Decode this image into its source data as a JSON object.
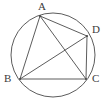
{
  "figure": {
    "background_color": "#ffffff",
    "stroke_color": "#4a4a4a",
    "label_color": "#3b3b3b",
    "circle": {
      "name": "circumcircle",
      "cx": 53,
      "cy": 55,
      "r": 42
    },
    "vertices": [
      {
        "id": "A",
        "label": "A",
        "x": 40,
        "y": 16,
        "label_x": 38,
        "label_y": 1
      },
      {
        "id": "B",
        "label": "B",
        "x": 20,
        "y": 79,
        "label_x": 4,
        "label_y": 73
      },
      {
        "id": "C",
        "label": "C",
        "x": 86,
        "y": 79,
        "label_x": 92,
        "label_y": 73
      },
      {
        "id": "D",
        "label": "D",
        "x": 87,
        "y": 36,
        "label_x": 92,
        "label_y": 24
      }
    ],
    "segments": [
      {
        "name": "side-AB",
        "from": "A",
        "to": "B",
        "x1": 40,
        "y1": 16,
        "x2": 20,
        "y2": 79
      },
      {
        "name": "side-AD",
        "from": "A",
        "to": "D",
        "x1": 40,
        "y1": 16,
        "x2": 87,
        "y2": 36
      },
      {
        "name": "side-DC",
        "from": "D",
        "to": "C",
        "x1": 87,
        "y1": 36,
        "x2": 86,
        "y2": 79
      },
      {
        "name": "side-BC",
        "from": "B",
        "to": "C",
        "x1": 20,
        "y1": 79,
        "x2": 86,
        "y2": 79
      },
      {
        "name": "diagonal-AC",
        "from": "A",
        "to": "C",
        "x1": 40,
        "y1": 16,
        "x2": 86,
        "y2": 79
      },
      {
        "name": "diagonal-BD",
        "from": "B",
        "to": "D",
        "x1": 20,
        "y1": 79,
        "x2": 87,
        "y2": 36
      }
    ]
  }
}
